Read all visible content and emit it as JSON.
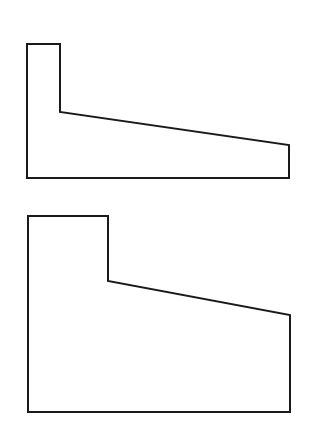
{
  "diagram": {
    "background": "#ffffff",
    "stroke_color": "#1a1a1a",
    "stroke_width": 2,
    "shapes": [
      {
        "name": "upper-retaining-wall-profile",
        "points": "27,44 60,44 60,112 289,145 289,178 27,178"
      },
      {
        "name": "lower-retaining-wall-profile",
        "points": "28,216 108,216 108,281 290,315 290,412 28,412"
      }
    ]
  }
}
